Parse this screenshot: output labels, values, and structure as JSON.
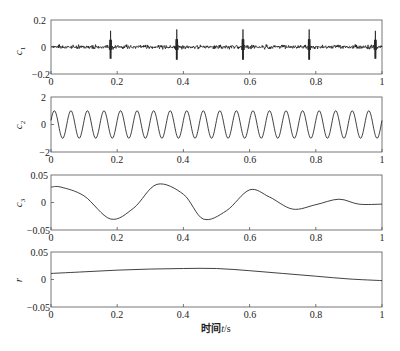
{
  "chart_data": [
    {
      "type": "line",
      "panel": 1,
      "ylabel": "c1",
      "ylim": [
        -0.2,
        0.2
      ],
      "yticks": [
        "0.2",
        "0",
        "−0.2"
      ],
      "xlim": [
        0,
        1
      ],
      "xticks": [
        "0",
        "0.2",
        "0.4",
        "0.6",
        "0.8",
        "1"
      ],
      "description": "High-frequency noise component with amplitude ~0.02 and periodic impulses",
      "impulses": [
        {
          "x": 0.18,
          "amplitude": 0.12
        },
        {
          "x": 0.38,
          "amplitude": 0.13
        },
        {
          "x": 0.58,
          "amplitude": 0.13
        },
        {
          "x": 0.78,
          "amplitude": 0.13
        },
        {
          "x": 0.98,
          "amplitude": 0.12
        }
      ],
      "noise_amplitude": 0.02
    },
    {
      "type": "line",
      "panel": 2,
      "ylabel": "c2",
      "ylim": [
        -2,
        2
      ],
      "yticks": [
        "2",
        "0",
        "−2"
      ],
      "xlim": [
        0,
        1
      ],
      "xticks": [
        "0",
        "0.2",
        "0.4",
        "0.6",
        "0.8",
        "1"
      ],
      "description": "Sinusoid, amplitude 1, about 20 cycles over [0,1]",
      "amplitude": 1,
      "frequency_cycles": 20
    },
    {
      "type": "line",
      "panel": 3,
      "ylabel": "c3",
      "ylim": [
        -0.05,
        0.05
      ],
      "yticks": [
        "0.05",
        "0",
        "−0.05"
      ],
      "xlim": [
        0,
        1
      ],
      "xticks": [
        "0",
        "0.2",
        "0.4",
        "0.6",
        "0.8",
        "1"
      ],
      "x": [
        0,
        0.03,
        0.1,
        0.18,
        0.25,
        0.32,
        0.4,
        0.46,
        0.53,
        0.6,
        0.66,
        0.73,
        0.8,
        0.87,
        0.93,
        1.0
      ],
      "values": [
        0.028,
        0.028,
        0.012,
        -0.03,
        -0.01,
        0.033,
        0.015,
        -0.03,
        -0.015,
        0.023,
        0.01,
        -0.012,
        -0.004,
        0.006,
        -0.003,
        -0.003
      ]
    },
    {
      "type": "line",
      "panel": 4,
      "ylabel": "r",
      "ylim": [
        -0.05,
        0.05
      ],
      "yticks": [
        "0.05",
        "0",
        "−0.05"
      ],
      "xlim": [
        0,
        1
      ],
      "xticks": [
        "0",
        "0.2",
        "0.4",
        "0.6",
        "0.8",
        "1"
      ],
      "xlabel": "时间t/s",
      "x": [
        0,
        0.1,
        0.2,
        0.3,
        0.4,
        0.5,
        0.6,
        0.7,
        0.8,
        0.9,
        1.0
      ],
      "values": [
        0.011,
        0.014,
        0.017,
        0.019,
        0.02,
        0.02,
        0.016,
        0.011,
        0.006,
        0.001,
        -0.002
      ]
    }
  ],
  "labels": {
    "xlabel_cn": "时间",
    "xlabel_var": "t",
    "xlabel_unit": "/s",
    "p1_ylabel": "c",
    "p1_sub": "1",
    "p2_ylabel": "c",
    "p2_sub": "2",
    "p3_ylabel": "c",
    "p3_sub": "3",
    "p4_ylabel": "r",
    "xt0": "0",
    "xt1": "0.2",
    "xt2": "0.4",
    "xt3": "0.6",
    "xt4": "0.8",
    "xt5": "1",
    "p1_yt_top": "0.2",
    "p1_yt_mid": "0",
    "p1_yt_bot": "−0.2",
    "p2_yt_top": "2",
    "p2_yt_mid": "0",
    "p2_yt_bot": "−2",
    "p3_yt_top": "0.05",
    "p3_yt_mid": "0",
    "p3_yt_bot": "−0.05",
    "p4_yt_top": "0.05",
    "p4_yt_mid": "0",
    "p4_yt_bot": "−0.05"
  },
  "style": {
    "line_color": "#1a1a1a",
    "axis_color": "#555555"
  }
}
